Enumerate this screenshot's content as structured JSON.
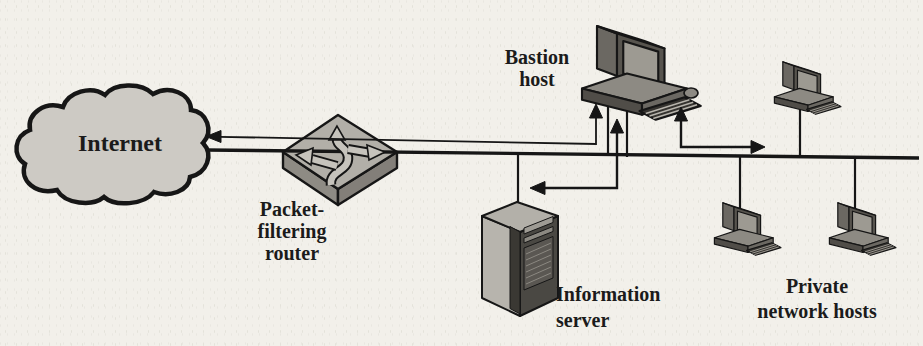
{
  "diagram": {
    "background_color": "#f2f0ea",
    "ink_color": "#1b1b1b",
    "labels": {
      "internet": "Internet",
      "router": [
        "Packet-",
        "filtering",
        "router"
      ],
      "bastion_host": [
        "Bastion",
        "host"
      ],
      "information_server": [
        "Information",
        "server"
      ],
      "private_hosts": [
        "Private",
        "network hosts"
      ]
    },
    "nodes": [
      {
        "id": "internet",
        "icon": "cloud",
        "label": "Internet"
      },
      {
        "id": "packet-filtering-router",
        "icon": "router-diamond",
        "label": "Packet-filtering router"
      },
      {
        "id": "bastion-host",
        "icon": "desktop-computer",
        "label": "Bastion host"
      },
      {
        "id": "information-server",
        "icon": "tower-server",
        "label": "Information server"
      },
      {
        "id": "private-host-top",
        "icon": "desktop-computer",
        "label": "Private network hosts"
      },
      {
        "id": "private-host-left",
        "icon": "desktop-computer",
        "label": "Private network hosts"
      },
      {
        "id": "private-host-right",
        "icon": "desktop-computer",
        "label": "Private network hosts"
      }
    ],
    "connections": [
      {
        "from": "packet-filtering-router",
        "to": "internet",
        "type": "arrow"
      },
      {
        "from": "packet-filtering-router",
        "to": "bastion-host",
        "type": "arrow"
      },
      {
        "from": "information-server",
        "to": "bastion-host",
        "type": "double-headed-bent-arrow"
      },
      {
        "from": "private-network",
        "to": "bastion-host",
        "type": "double-headed-bent-arrow"
      },
      {
        "from": "lan-bus",
        "to": "bastion-host",
        "type": "line"
      },
      {
        "from": "lan-bus",
        "to": "information-server",
        "type": "line"
      },
      {
        "from": "lan-bus",
        "to": "private-host-top",
        "type": "line"
      },
      {
        "from": "lan-bus",
        "to": "private-host-left",
        "type": "line"
      },
      {
        "from": "lan-bus",
        "to": "private-host-right",
        "type": "line"
      }
    ],
    "colors": {
      "cloud_fill": "#cdcac4",
      "router_top": "#b2afa8",
      "router_side": "#8e8b84",
      "machine_body": "#6b6862",
      "machine_dark": "#504d48",
      "screen": "#9d9a92",
      "server_face": "#b7b4ad",
      "server_side": "#4a4843"
    }
  }
}
